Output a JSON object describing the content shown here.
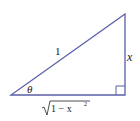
{
  "diagram": {
    "type": "right-triangle",
    "stroke_color": "#5a5fa8",
    "labels": {
      "hypotenuse": "1",
      "opposite": "x",
      "angle": "θ",
      "adjacent_radical": "1 − x",
      "adjacent_exponent": "2"
    }
  }
}
